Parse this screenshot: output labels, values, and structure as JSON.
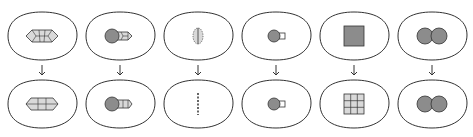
{
  "diagram": {
    "type": "cell-transformation-sequence",
    "colors": {
      "outline": "#333333",
      "light_fill": "#d9d9d9",
      "dark_fill": "#8c8c8c",
      "background": "#ffffff"
    },
    "columns": [
      {
        "id": "col-1",
        "top": "hexagonal-segmented-body",
        "bottom": "rounded-segmented-body"
      },
      {
        "id": "col-2",
        "top": "circle-with-segmented-tail",
        "bottom": "circle-with-rounded-tail"
      },
      {
        "id": "col-3",
        "top": "dotted-oval-split",
        "bottom": "dotted-line"
      },
      {
        "id": "col-4",
        "top": "circle-with-square-knob",
        "bottom": "circle-with-square-knob"
      },
      {
        "id": "col-5",
        "top": "solid-square",
        "bottom": "3x3-grid-square"
      },
      {
        "id": "col-6",
        "top": "two-overlapping-circles",
        "bottom": "two-overlapping-circles"
      }
    ],
    "arrow_glyph": "down-arrow"
  }
}
